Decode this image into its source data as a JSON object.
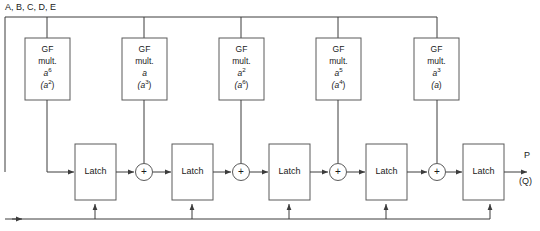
{
  "diagram": {
    "title_label": "A, B, C, D, E",
    "input_bus": {
      "label": "A, B, C, D, E"
    },
    "gf_blocks": [
      {
        "line1": "GF",
        "line2": "mult.",
        "coef": "a",
        "coef_sup": "6",
        "alt": "(a",
        "alt_sup": "2",
        "alt_close": ")"
      },
      {
        "line1": "GF",
        "line2": "mult.",
        "coef": "a",
        "coef_sup": "",
        "alt": "(a",
        "alt_sup": "3",
        "alt_close": ")"
      },
      {
        "line1": "GF",
        "line2": "mult.",
        "coef": "a",
        "coef_sup": "2",
        "alt": "(a",
        "alt_sup": "6",
        "alt_close": ")"
      },
      {
        "line1": "GF",
        "line2": "mult.",
        "coef": "a",
        "coef_sup": "5",
        "alt": "(a",
        "alt_sup": "4",
        "alt_close": ")"
      },
      {
        "line1": "GF",
        "line2": "mult.",
        "coef": "a",
        "coef_sup": "3",
        "alt": "(a",
        "alt_sup": "",
        "alt_close": ")"
      }
    ],
    "latches": [
      {
        "label": "Latch"
      },
      {
        "label": "Latch"
      },
      {
        "label": "Latch"
      },
      {
        "label": "Latch"
      },
      {
        "label": "Latch"
      }
    ],
    "adders": [
      {
        "symbol": "+"
      },
      {
        "symbol": "+"
      },
      {
        "symbol": "+"
      },
      {
        "symbol": "+"
      }
    ],
    "outputs": {
      "primary": "P",
      "alternate": "(Q)"
    },
    "colors": {
      "wire": "#3c3c3c",
      "box_stroke": "#5a5a5a",
      "text": "#1a1a1a",
      "background": "#ffffff"
    }
  }
}
